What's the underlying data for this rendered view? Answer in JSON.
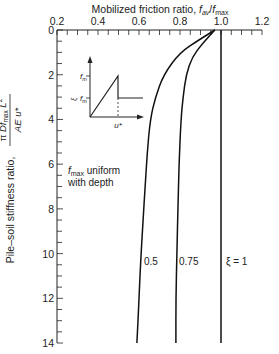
{
  "chart_data": {
    "type": "line",
    "xlabel": "Mobilized friction ratio, f_av/f_max",
    "ylabel": "Pile-soil stiffness ratio, πDf_max L² / (AE u*)",
    "xlim": [
      0.2,
      1.2
    ],
    "ylim": [
      0,
      14
    ],
    "y_inverted": true,
    "x_axis_position": "top",
    "x_ticks": [
      0.2,
      0.4,
      0.6,
      0.8,
      1.0,
      1.2
    ],
    "x_tick_labels": [
      "0.2",
      "0.4",
      "0.6",
      "0.8",
      "1.0",
      "1.2"
    ],
    "y_ticks": [
      0,
      2,
      4,
      6,
      8,
      10,
      12,
      14
    ],
    "y_tick_labels": [
      "0",
      "2",
      "4",
      "6",
      "8",
      "10",
      "12",
      "14"
    ],
    "grid": false,
    "series": [
      {
        "name": "ξ = 0.5",
        "label": "0.5",
        "points": [
          [
            0.97,
            0
          ],
          [
            0.9,
            0.4
          ],
          [
            0.8,
            1.0
          ],
          [
            0.72,
            2.0
          ],
          [
            0.68,
            3.0
          ],
          [
            0.655,
            4.0
          ],
          [
            0.64,
            5.5
          ],
          [
            0.63,
            7.0
          ],
          [
            0.62,
            8.5
          ],
          [
            0.61,
            10.0
          ],
          [
            0.6,
            12.0
          ],
          [
            0.59,
            14.0
          ]
        ]
      },
      {
        "name": "ξ = 0.75",
        "label": "0.75",
        "points": [
          [
            0.97,
            0
          ],
          [
            0.91,
            0.6
          ],
          [
            0.86,
            1.2
          ],
          [
            0.83,
            2.0
          ],
          [
            0.815,
            3.0
          ],
          [
            0.805,
            4.0
          ],
          [
            0.795,
            6.0
          ],
          [
            0.79,
            8.0
          ],
          [
            0.785,
            10.0
          ],
          [
            0.78,
            12.0
          ],
          [
            0.78,
            14.0
          ]
        ]
      },
      {
        "name": "ξ = 1",
        "label": "ξ = 1",
        "points": [
          [
            1.0,
            0
          ],
          [
            1.0,
            14.0
          ]
        ]
      }
    ],
    "annotations": [
      {
        "text": "f_max uniform with depth",
        "line1": "uniform",
        "line2": "with depth"
      }
    ],
    "inset": {
      "description": "Softening friction-displacement curve",
      "y_labels": [
        "f_m",
        "ξ f_m"
      ],
      "x_label": "u*"
    }
  },
  "labels": {
    "x_title_main": "Mobilized friction ratio, ",
    "x_title_f": "f",
    "x_title_av": "av",
    "x_title_slash": "/",
    "x_title_max": "max",
    "y_title_text": "Pile–soil stiffness ratio,",
    "y_num_pi": "π",
    "y_num_D": " Df",
    "y_num_max": "max",
    "y_num_L": " L",
    "y_num_sq": "2",
    "y_den": "AE u*",
    "annot_f": "f",
    "annot_max": "max",
    "annot_l1": " uniform",
    "annot_l2": "with depth",
    "series_05": "0.5",
    "series_075": "0.75",
    "series_1": "ξ = 1",
    "inset_fm": "f",
    "inset_fm_sub": "m",
    "inset_xi": "ξ",
    "inset_u": "u*"
  }
}
